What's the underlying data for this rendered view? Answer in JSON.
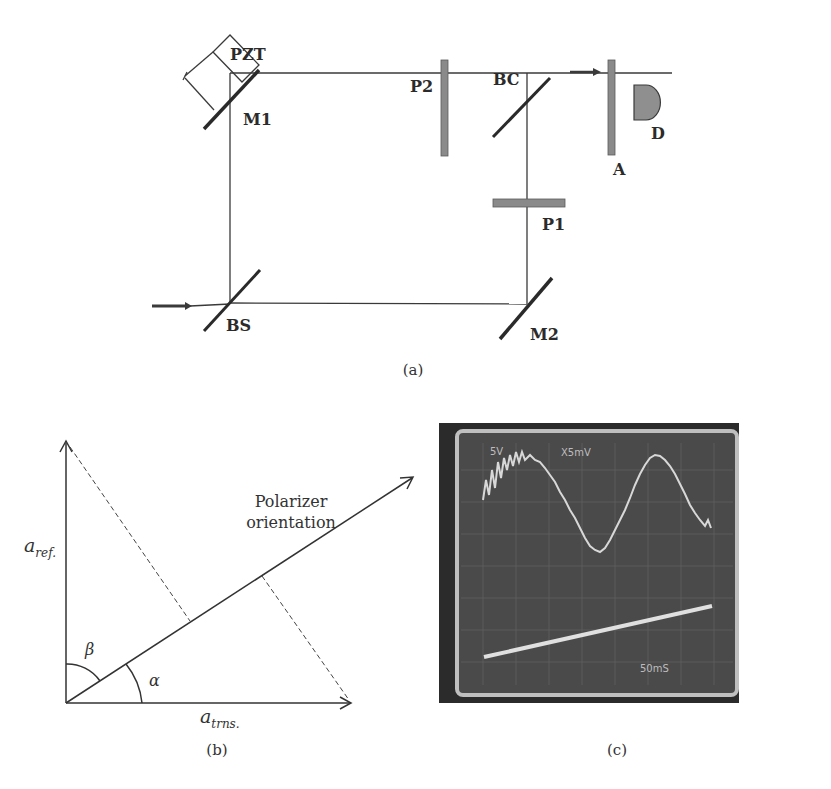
{
  "panel_a": {
    "caption": "(a)",
    "labels": {
      "pzt": "PZT",
      "m1": "M1",
      "p2": "P2",
      "bc": "BC",
      "a": "A",
      "d": "D",
      "p1": "P1",
      "bs": "BS",
      "m2": "M2"
    },
    "colors": {
      "line": "#3a3a3a",
      "plate": "#8a8a8a",
      "detector": "#8f8f8f"
    }
  },
  "panel_b": {
    "caption": "(b)",
    "axis_y_label_main": "a",
    "axis_y_label_sub": "ref.",
    "axis_x_label_main": "a",
    "axis_x_label_sub": "trns.",
    "angle_alpha": "α",
    "angle_beta": "β",
    "polarizer_line1": "Polarizer",
    "polarizer_line2": "orientation"
  },
  "panel_c": {
    "caption": "(c)",
    "scope_text_ch1": "5V",
    "scope_text_ch2": "X5mV",
    "scope_text_time": "50mS",
    "colors": {
      "bezel": "#2b2b2b",
      "screen": "#4a4a4a",
      "frame": "#bfbfbf",
      "trace": "#d8d8d8"
    }
  }
}
